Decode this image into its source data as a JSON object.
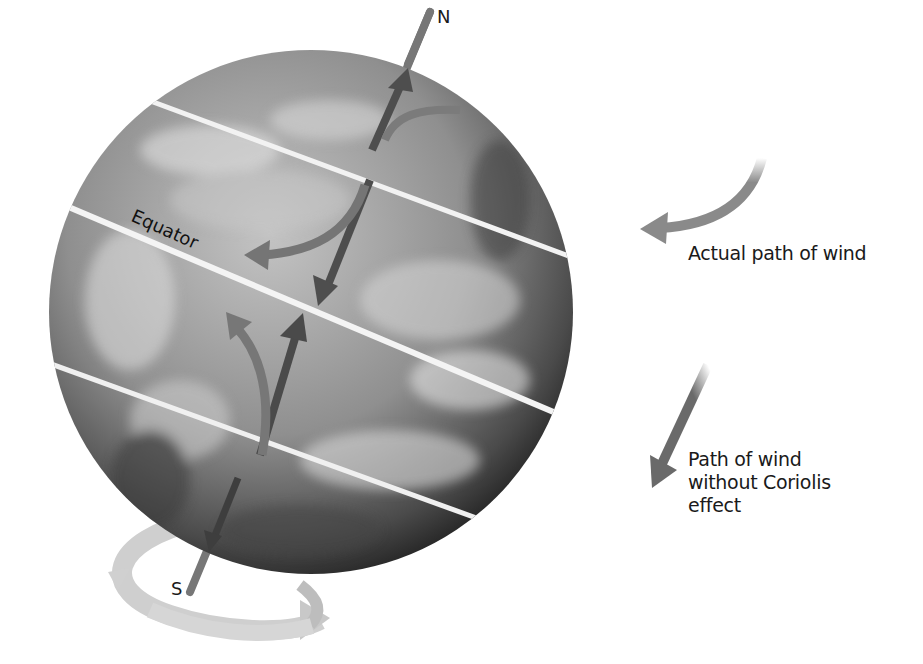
{
  "figure": {
    "poles": {
      "north": "N",
      "south": "S"
    },
    "equator_label": "Equator",
    "legend": [
      {
        "id": "actual",
        "label": "Actual path of wind",
        "icon": "curved-arrow-icon"
      },
      {
        "id": "without",
        "label_lines": [
          "Path of wind",
          "without Coriolis",
          "effect"
        ],
        "icon": "straight-arrow-icon"
      }
    ],
    "colors": {
      "background": "#ffffff",
      "globe_dark": "#3a3a3a",
      "globe_light": "#b8b8b8",
      "latitude_lines": "#f2f2f2",
      "curved_arrow": "#7a7a7a",
      "straight_arrow": "#555555",
      "rotation_arrow": "#c8c8c8",
      "axis": "#6e6e6e",
      "text": "#1a1a1a"
    }
  }
}
